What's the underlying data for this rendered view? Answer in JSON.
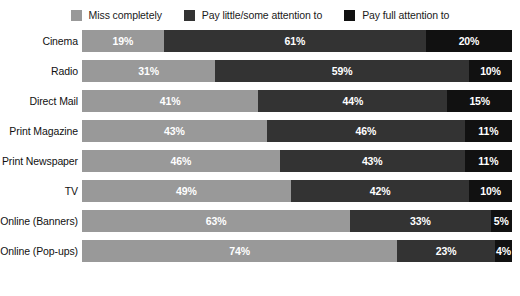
{
  "legend": {
    "position": "top-center",
    "entries": [
      {
        "label": "Miss completely",
        "color": "#999999",
        "swatch_name": "legend-swatch-miss-completely"
      },
      {
        "label": "Pay little/some attention to",
        "color": "#333333",
        "swatch_name": "legend-swatch-pay-little-some"
      },
      {
        "label": "Pay full attention to",
        "color": "#111111",
        "swatch_name": "legend-swatch-pay-full"
      }
    ]
  },
  "chart_data": {
    "type": "bar",
    "orientation": "horizontal",
    "stacked": true,
    "stack_total": 100,
    "title": "",
    "subtitle": "",
    "xlabel": "",
    "ylabel": "",
    "xlim": [
      0,
      100
    ],
    "grid": false,
    "legend_position": "top-center",
    "value_suffix": "%",
    "categories": [
      "Cinema",
      "Radio",
      "Direct Mail",
      "Print Magazine",
      "Print Newspaper",
      "TV",
      "Online (Banners)",
      "Online (Pop-ups)"
    ],
    "series": [
      {
        "name": "Miss completely",
        "color": "#999999",
        "values": [
          19,
          31,
          41,
          43,
          46,
          49,
          63,
          74
        ],
        "labels": [
          "19%",
          "31%",
          "41%",
          "43%",
          "46%",
          "49%",
          "63%",
          "74%"
        ]
      },
      {
        "name": "Pay little/some attention to",
        "color": "#333333",
        "values": [
          61,
          59,
          44,
          46,
          43,
          42,
          33,
          23
        ],
        "labels": [
          "61%",
          "59%",
          "44%",
          "46%",
          "43%",
          "42%",
          "33%",
          "23%"
        ]
      },
      {
        "name": "Pay full attention to",
        "color": "#111111",
        "values": [
          20,
          10,
          15,
          11,
          11,
          10,
          5,
          4
        ],
        "labels": [
          "20%",
          "10%",
          "15%",
          "11%",
          "11%",
          "10%",
          "5%",
          "4%"
        ]
      }
    ]
  }
}
